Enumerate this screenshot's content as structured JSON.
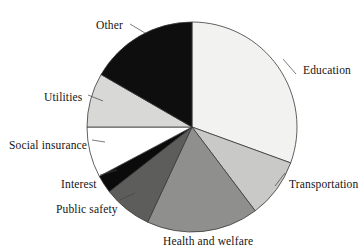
{
  "figure": {
    "name": "government-spending-pie-chart",
    "background": "#ffffff"
  },
  "chart_data": {
    "type": "pie",
    "title": "",
    "xlabel": "",
    "ylabel": "",
    "legend_position": "none",
    "labels_position": "outside-callout",
    "grid": false,
    "center": {
      "x": 192,
      "y": 127
    },
    "radius": 105,
    "start_angle_deg": 0,
    "direction": "clockwise",
    "categories": [
      "Education",
      "Transportation",
      "Health and welfare",
      "Public safety",
      "Interest",
      "Social insurance",
      "Utilities",
      "Other"
    ],
    "values": [
      30.6,
      9.2,
      17.2,
      7.5,
      2.8,
      7.8,
      8.3,
      16.6
    ],
    "units": "percent",
    "slices": [
      {
        "label": "Education",
        "value": 30.6,
        "start_deg": 0,
        "end_deg": 110,
        "color": "#f2f2f0",
        "edge": "#3a3a3a",
        "label_x": 303,
        "label_y": 64
      },
      {
        "label": "Transportation",
        "value": 9.2,
        "start_deg": 110,
        "end_deg": 143,
        "color": "#c9c9c7",
        "edge": "#3a3a3a",
        "label_x": 289,
        "label_y": 178
      },
      {
        "label": "Health and welfare",
        "value": 17.2,
        "start_deg": 143,
        "end_deg": 205,
        "color": "#8f8f8d",
        "edge": "#3a3a3a",
        "label_x": 163,
        "label_y": 235
      },
      {
        "label": "Public safety",
        "value": 7.5,
        "start_deg": 205,
        "end_deg": 232,
        "color": "#5d5d5b",
        "edge": "#3a3a3a",
        "label_x": 56,
        "label_y": 203
      },
      {
        "label": "Interest",
        "value": 2.8,
        "start_deg": 232,
        "end_deg": 242,
        "color": "#0b0b0b",
        "edge": "#3a3a3a",
        "label_x": 61,
        "label_y": 178
      },
      {
        "label": "Social insurance",
        "value": 7.8,
        "start_deg": 242,
        "end_deg": 270,
        "color": "#ffffff",
        "edge": "#3a3a3a",
        "label_x": 9,
        "label_y": 139
      },
      {
        "label": "Utilities",
        "value": 8.3,
        "start_deg": 270,
        "end_deg": 300,
        "color": "#d8d8d6",
        "edge": "#3a3a3a",
        "label_x": 44,
        "label_y": 91
      },
      {
        "label": "Other",
        "value": 16.6,
        "start_deg": 300,
        "end_deg": 360,
        "color": "#0e0e0e",
        "edge": "#3a3a3a",
        "label_x": 96,
        "label_y": 19
      }
    ],
    "leader_lines": [
      {
        "from_label": "Education",
        "x1": 296,
        "y1": 74,
        "x2": 283,
        "y2": 59
      },
      {
        "from_label": "Transportation",
        "x1": 285,
        "y1": 173,
        "x2": 275,
        "y2": 186
      },
      {
        "from_label": "Health and welfare",
        "x1": 205,
        "y1": 229,
        "x2": 205,
        "y2": 229
      },
      {
        "from_label": "Public safety",
        "x1": 120,
        "y1": 200,
        "x2": 135,
        "y2": 193
      },
      {
        "from_label": "Interest",
        "x1": 100,
        "y1": 175,
        "x2": 117,
        "y2": 170
      },
      {
        "from_label": "Social insurance",
        "x1": 92,
        "y1": 140,
        "x2": 105,
        "y2": 142
      },
      {
        "from_label": "Utilities",
        "x1": 88,
        "y1": 95,
        "x2": 103,
        "y2": 101
      },
      {
        "from_label": "Other",
        "x1": 130,
        "y1": 24,
        "x2": 145,
        "y2": 33
      }
    ]
  }
}
